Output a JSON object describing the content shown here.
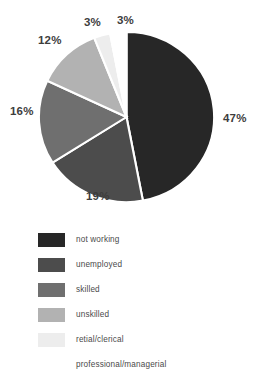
{
  "chart_title": "",
  "chart_data": {
    "type": "pie",
    "title": "",
    "xlabel": "",
    "ylabel": "",
    "legend_position": "bottom-left",
    "grid": false,
    "start_angle_deg": 0,
    "direction": "clockwise",
    "unit": "%",
    "categories": [
      "not working",
      "unemployed",
      "skilled",
      "unskilled",
      "retial/clerical",
      "professional/managerial"
    ],
    "values": [
      47,
      19,
      16,
      12,
      3,
      3
    ],
    "labels": [
      "47%",
      "19%",
      "16%",
      "12%",
      "3%",
      "3%"
    ],
    "colors": [
      "#272727",
      "#4c4c4c",
      "#6f6f6f",
      "#b2b2b2",
      "#ededed",
      "#ffffff"
    ],
    "slice_border_color": "#ffffff"
  },
  "pie_labels": {
    "not_working": "47%",
    "unemployed": "19%",
    "skilled": "16%",
    "unskilled": "12%",
    "retail_clerical": "3%",
    "professional_managerial": "3%"
  },
  "legend": {
    "items": [
      {
        "label": "not working",
        "color": "#272727"
      },
      {
        "label": "unemployed",
        "color": "#4c4c4c"
      },
      {
        "label": "skilled",
        "color": "#6f6f6f"
      },
      {
        "label": "unskilled",
        "color": "#b2b2b2"
      },
      {
        "label": "retial/clerical",
        "color": "#ededed"
      },
      {
        "label": "professional/managerial",
        "color": "#ffffff"
      }
    ]
  }
}
